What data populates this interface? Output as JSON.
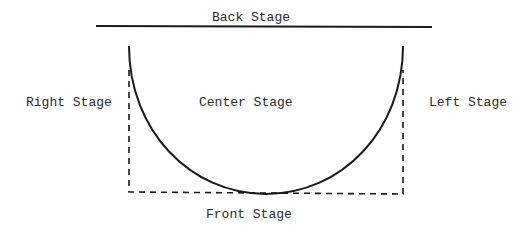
{
  "diagram": {
    "labels": {
      "back": "Back Stage",
      "right": "Right Stage",
      "center": "Center Stage",
      "left": "Left Stage",
      "front": "Front Stage"
    },
    "colors": {
      "line": "#1a1a1a",
      "text": "#2a2a2a",
      "background": "#ffffff"
    }
  }
}
